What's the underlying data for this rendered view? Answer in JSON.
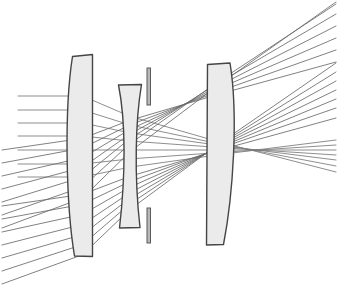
{
  "figure": {
    "width": 338,
    "height": 304,
    "background_color": "#ffffff"
  },
  "style": {
    "lens_fill": "#ebebeb",
    "lens_stroke": "#454545",
    "lens_stroke_width": 1.4,
    "ray_stroke": "#6a6a6a",
    "ray_stroke_width": 0.85,
    "stop_fill": "#b8b8b8",
    "stop_stroke": "#5a5a5a"
  },
  "elements": [
    {
      "id": "lens-1",
      "name": "front-positive-meniscus",
      "type": "lens",
      "shape": "convex-plano",
      "top_y": 54,
      "bottom_y": 256,
      "left_x": 72,
      "right_x": 93,
      "path": "M 72.5 56.5 L 92.5 54.5 L 92.5 256.5 L 74.5 256.0 C 66.0 205.0 64.0 110.0 72.5 56.5 Z"
    },
    {
      "id": "lens-2",
      "name": "middle-biconcave",
      "type": "lens",
      "shape": "biconcave",
      "top_y": 84,
      "bottom_y": 228,
      "left_x": 118,
      "right_x": 142,
      "path": "M 118.5 85.0 L 141.5 84.5 C 135.5 120.0 134.0 175.0 140.0 227.5 L 119.5 228.0 C 125.5 176.0 126.0 122.0 118.5 85.0 Z"
    },
    {
      "id": "lens-3",
      "name": "rear-positive-meniscus",
      "type": "lens",
      "shape": "plano-convex",
      "top_y": 63,
      "bottom_y": 245,
      "left_x": 206,
      "right_x": 231,
      "path": "M 207.5 64.5 L 230.0 63.0 C 238.5 115.0 233.0 196.0 223.5 244.5 L 206.5 245.0 Z"
    }
  ],
  "aperture_stop": {
    "name": "aperture-stop",
    "x": 147,
    "bar_width": 3.5,
    "upper_bar": {
      "top_y": 68,
      "bottom_y": 105
    },
    "lower_bar": {
      "top_y": 208,
      "bottom_y": 243
    }
  },
  "ray_bundles": [
    {
      "id": "bundle-axial",
      "name": "on-axis-ray-fan",
      "field_angle_deg": 0,
      "entry_x": 18,
      "entry_y": [
        96,
        110,
        123,
        136,
        150,
        164,
        177
      ],
      "exit_x": 336,
      "exit_y": [
        172,
        166,
        160,
        155,
        150,
        145,
        140
      ]
    },
    {
      "id": "bundle-mid",
      "name": "mid-field-ray-fan",
      "field_angle_deg": 9,
      "entry_x": 2,
      "entry_y": [
        206,
        219,
        232,
        245,
        258,
        271,
        284
      ],
      "exit_x": 336,
      "exit_y": [
        118,
        108,
        99,
        90,
        81,
        72,
        63
      ]
    },
    {
      "id": "bundle-full",
      "name": "full-field-ray-fan",
      "field_angle_deg": 18,
      "entry_x": 2,
      "entry_y": [
        150,
        163,
        176,
        189,
        202,
        215,
        228
      ],
      "exit_x": 336,
      "exit_y": [
        62,
        50,
        38,
        26,
        14,
        4,
        2
      ]
    }
  ]
}
